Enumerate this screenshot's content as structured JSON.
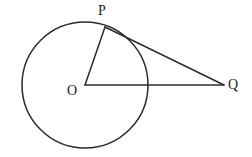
{
  "figure": {
    "background_color": "#ffffff",
    "stroke_color": "#2b2b2b",
    "label_color": "#1d1d1d",
    "width": 252,
    "height": 157
  },
  "labels": {
    "center": "O",
    "tangent_point": "P",
    "external_point": "Q"
  },
  "geometry": {
    "circle": {
      "cx": 85,
      "cy": 85,
      "r": 63
    },
    "points": {
      "O": {
        "x": 85,
        "y": 85
      },
      "P": {
        "x": 105,
        "y": 27
      },
      "Q": {
        "x": 224,
        "y": 85
      }
    },
    "segments": [
      {
        "name": "radius-OP",
        "from": "O",
        "to": "P"
      },
      {
        "name": "tangent-PQ",
        "from": "P",
        "to": "Q"
      },
      {
        "name": "secant-OQ",
        "from": "O",
        "to": "Q"
      }
    ]
  }
}
